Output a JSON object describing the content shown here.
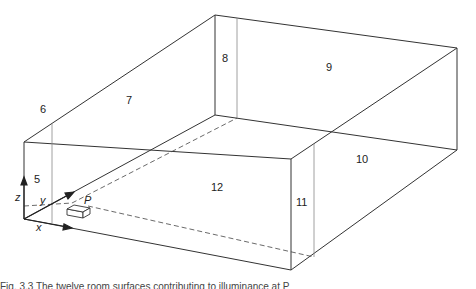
{
  "figure": {
    "surfaces": [
      {
        "id": "5",
        "label": "5",
        "x": 38,
        "y": 180
      },
      {
        "id": "6",
        "label": "6",
        "x": 44,
        "y": 113
      },
      {
        "id": "7",
        "label": "7",
        "x": 130,
        "y": 103
      },
      {
        "id": "8",
        "label": "8",
        "x": 226,
        "y": 62
      },
      {
        "id": "9",
        "label": "9",
        "x": 330,
        "y": 71
      },
      {
        "id": "10",
        "label": "10",
        "x": 362,
        "y": 162
      },
      {
        "id": "11",
        "label": "11",
        "x": 302,
        "y": 206
      },
      {
        "id": "12",
        "label": "12",
        "x": 217,
        "y": 190
      }
    ],
    "point": {
      "label": "P"
    },
    "axes": {
      "x": "x",
      "y": "y",
      "z": "z"
    }
  },
  "caption": "Fig. 3.3 The twelve room surfaces contributing to illuminance at P"
}
